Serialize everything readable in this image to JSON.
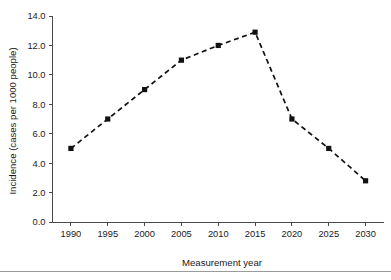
{
  "chart_data": {
    "type": "line",
    "title": "",
    "subtitle": "",
    "xlabel": "Measurement year",
    "ylabel": "Incidence (cases per 1000 people)",
    "x": [
      1990,
      1995,
      2000,
      2005,
      2010,
      2015,
      2020,
      2025,
      2030
    ],
    "values": [
      5.0,
      7.0,
      9.0,
      11.0,
      12.0,
      12.9,
      7.0,
      5.0,
      2.8
    ],
    "series": [
      {
        "name": "Incidence",
        "values": [
          5.0,
          7.0,
          9.0,
          11.0,
          12.0,
          12.9,
          7.0,
          5.0,
          2.8
        ]
      }
    ],
    "xtick_labels": [
      "1990",
      "1995",
      "2000",
      "2005",
      "2010",
      "2015",
      "2020",
      "2025",
      "2030"
    ],
    "ytick_labels": [
      "0.0",
      "2.0",
      "4.0",
      "6.0",
      "8.0",
      "10.0",
      "12.0",
      "14.0"
    ],
    "ytick_values": [
      0.0,
      2.0,
      4.0,
      6.0,
      8.0,
      10.0,
      12.0,
      14.0
    ],
    "xlim": [
      1987.5,
      2032.5
    ],
    "ylim": [
      0.0,
      14.0
    ],
    "grid": false,
    "legend": false,
    "legend_position": "none",
    "marker": "square",
    "linestyle": "dashed",
    "line_color": "#111111",
    "marker_color": "#111111",
    "axis_color": "#4a4a4a",
    "background_color": "#ffffff"
  }
}
